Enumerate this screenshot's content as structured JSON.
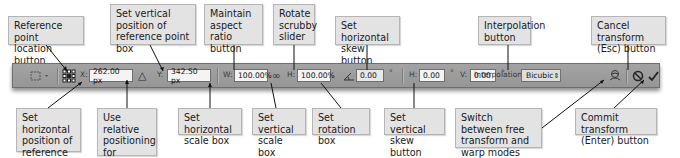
{
  "toolbar": {
    "x_value": "262.00 px",
    "x_label": "X:",
    "y_value": "342.50 px",
    "y_label": "Y:",
    "w_label": "W:",
    "w_value": "100.00%",
    "h_label": "H:",
    "h_value": "100.00%",
    "rotate_value": "0.00",
    "degree_symbol": "°",
    "hskew_label": "H:",
    "hskew_value": "0.00",
    "vskew_label": "V:",
    "vskew_value": "0.00",
    "interpolation_label": "Interpolation:",
    "interpolation_value": "Bicubic",
    "select_arrow": "⇕",
    "link_glyph": "∞",
    "relative_glyph": "△",
    "rotate_glyph": "◬",
    "cancel_glyph": "⃠",
    "commit_glyph": "✔"
  },
  "callouts": {
    "reference_point_location": "Reference point location button",
    "vertical_position": "Set vertical position of reference point box",
    "maintain_aspect": "Maintain aspect ratio button",
    "rotate_scrubby": "Rotate scrubby slider",
    "horizontal_skew": "Set horizontal skew button",
    "interpolation": "Interpolation button",
    "cancel_transform": "Cancel transform (Esc) button",
    "horizontal_position": "Set horizontal position of reference point box",
    "relative_positioning": "Use relative positioning for reference point button",
    "horizontal_scale": "Set horizontal scale box",
    "vertical_scale": "Set vertical scale box",
    "rotation": "Set rotation box",
    "vertical_skew": "Set vertical skew button",
    "switch_warp": "Switch between free transform and warp modes button",
    "commit_transform": "Commit transform (Enter) button"
  }
}
